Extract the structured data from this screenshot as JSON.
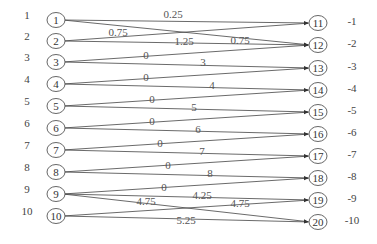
{
  "diagram": {
    "type": "bipartite-flow-network",
    "left_nodes": [
      {
        "id": "1",
        "label": "1",
        "y": 20
      },
      {
        "id": "2",
        "label": "2",
        "y": 41
      },
      {
        "id": "3",
        "label": "3",
        "y": 62
      },
      {
        "id": "4",
        "label": "4",
        "y": 84
      },
      {
        "id": "5",
        "label": "5",
        "y": 106
      },
      {
        "id": "6",
        "label": "6",
        "y": 128
      },
      {
        "id": "7",
        "label": "7",
        "y": 150
      },
      {
        "id": "8",
        "label": "8",
        "y": 172
      },
      {
        "id": "9",
        "label": "9",
        "y": 194
      },
      {
        "id": "10",
        "label": "10",
        "y": 216
      }
    ],
    "right_nodes": [
      {
        "id": "11",
        "label": "-1",
        "y": 23
      },
      {
        "id": "12",
        "label": "-2",
        "y": 45
      },
      {
        "id": "13",
        "label": "-3",
        "y": 68
      },
      {
        "id": "14",
        "label": "-4",
        "y": 90
      },
      {
        "id": "15",
        "label": "-5",
        "y": 112
      },
      {
        "id": "16",
        "label": "-6",
        "y": 134
      },
      {
        "id": "17",
        "label": "-7",
        "y": 156
      },
      {
        "id": "18",
        "label": "-8",
        "y": 178
      },
      {
        "id": "19",
        "label": "-9",
        "y": 200
      },
      {
        "id": "20",
        "label": "-10",
        "y": 222
      }
    ],
    "edges": [
      {
        "from": "1",
        "to": "11",
        "weight": "0.25",
        "lx": 173,
        "ly": 18
      },
      {
        "from": "1",
        "to": "12",
        "weight": "0.75",
        "lx": 240,
        "ly": 44
      },
      {
        "from": "2",
        "to": "11",
        "weight": "0.75",
        "lx": 118,
        "ly": 36
      },
      {
        "from": "2",
        "to": "12",
        "weight": "1.25",
        "lx": 184,
        "ly": 45
      },
      {
        "from": "3",
        "to": "12",
        "weight": "0",
        "lx": 146,
        "ly": 59
      },
      {
        "from": "3",
        "to": "13",
        "weight": "3",
        "lx": 203,
        "ly": 66
      },
      {
        "from": "4",
        "to": "13",
        "weight": "0",
        "lx": 146,
        "ly": 81
      },
      {
        "from": "4",
        "to": "14",
        "weight": "4",
        "lx": 212,
        "ly": 89
      },
      {
        "from": "5",
        "to": "14",
        "weight": "0",
        "lx": 152,
        "ly": 103
      },
      {
        "from": "5",
        "to": "15",
        "weight": "5",
        "lx": 194,
        "ly": 111
      },
      {
        "from": "6",
        "to": "15",
        "weight": "0",
        "lx": 152,
        "ly": 125
      },
      {
        "from": "6",
        "to": "16",
        "weight": "6",
        "lx": 198,
        "ly": 133
      },
      {
        "from": "7",
        "to": "16",
        "weight": "0",
        "lx": 160,
        "ly": 147
      },
      {
        "from": "7",
        "to": "17",
        "weight": "7",
        "lx": 202,
        "ly": 155
      },
      {
        "from": "8",
        "to": "17",
        "weight": "0",
        "lx": 168,
        "ly": 169
      },
      {
        "from": "8",
        "to": "18",
        "weight": "8",
        "lx": 210,
        "ly": 177
      },
      {
        "from": "9",
        "to": "18",
        "weight": "0",
        "lx": 164,
        "ly": 191
      },
      {
        "from": "9",
        "to": "19",
        "weight": "4.25",
        "lx": 202,
        "ly": 199
      },
      {
        "from": "9",
        "to": "20",
        "weight": "4.75",
        "lx": 146,
        "ly": 205
      },
      {
        "from": "10",
        "to": "19",
        "weight": "4.75",
        "lx": 240,
        "ly": 207
      },
      {
        "from": "10",
        "to": "20",
        "weight": "5.25",
        "lx": 186,
        "ly": 224
      }
    ],
    "layout": {
      "left_label_x": 27,
      "left_node_x": 56,
      "right_node_x": 318,
      "right_label_x": 352,
      "node_rx": 9,
      "node_ry": 7.5
    }
  }
}
